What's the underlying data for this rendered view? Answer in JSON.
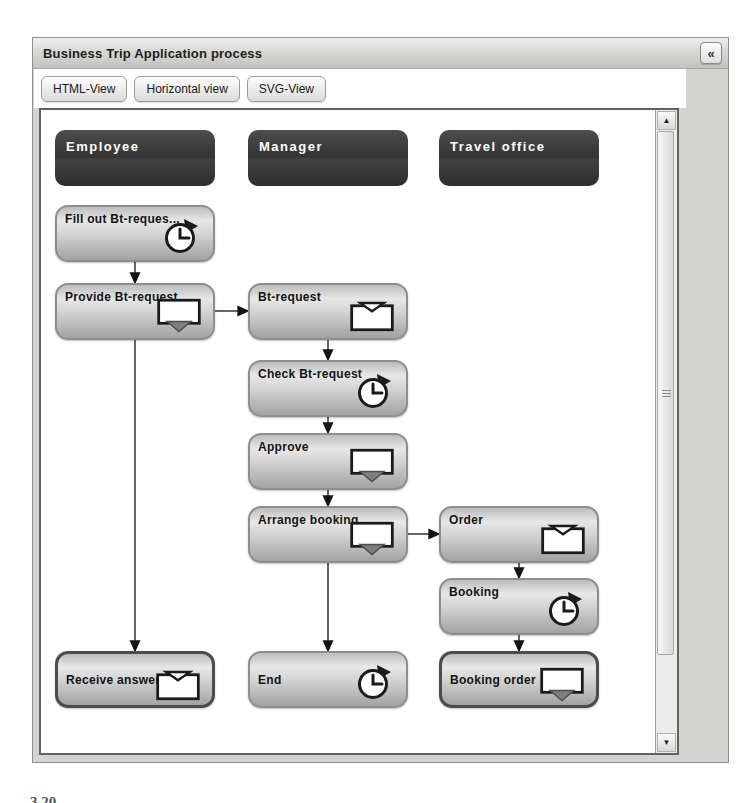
{
  "window": {
    "title": "Business Trip Application process",
    "collapse_button_glyph": "«"
  },
  "toolbar": {
    "buttons": [
      {
        "label": "HTML-View"
      },
      {
        "label": "Horizontal view"
      },
      {
        "label": "SVG-View"
      }
    ]
  },
  "diagram": {
    "lanes": [
      {
        "label": "Employee"
      },
      {
        "label": "Manager"
      },
      {
        "label": "Travel office"
      }
    ],
    "nodes": [
      {
        "id": "fill-out-bt-request",
        "lane": "Employee",
        "label": "Fill out Bt-reques...",
        "icon": "timer",
        "end_event": false
      },
      {
        "id": "provide-bt-request",
        "lane": "Employee",
        "label": "Provide Bt-request",
        "icon": "send-message",
        "end_event": false
      },
      {
        "id": "bt-request",
        "lane": "Manager",
        "label": "Bt-request",
        "icon": "receive-message",
        "end_event": false
      },
      {
        "id": "check-bt-request",
        "lane": "Manager",
        "label": "Check Bt-request",
        "icon": "timer",
        "end_event": false
      },
      {
        "id": "approve",
        "lane": "Manager",
        "label": "Approve",
        "icon": "send-message",
        "end_event": false
      },
      {
        "id": "arrange-booking",
        "lane": "Manager",
        "label": "Arrange booking",
        "icon": "send-message",
        "end_event": false
      },
      {
        "id": "order",
        "lane": "Travel office",
        "label": "Order",
        "icon": "receive-message",
        "end_event": false
      },
      {
        "id": "booking",
        "lane": "Travel office",
        "label": "Booking",
        "icon": "timer",
        "end_event": false
      },
      {
        "id": "receive-answer",
        "lane": "Employee",
        "label": "Receive answer",
        "icon": "receive-message",
        "end_event": true
      },
      {
        "id": "end",
        "lane": "Manager",
        "label": "End",
        "icon": "timer",
        "end_event": false
      },
      {
        "id": "booking-order",
        "lane": "Travel office",
        "label": "Booking order",
        "icon": "send-message",
        "end_event": true
      }
    ],
    "edges": [
      {
        "from": "fill-out-bt-request",
        "to": "provide-bt-request"
      },
      {
        "from": "provide-bt-request",
        "to": "bt-request"
      },
      {
        "from": "bt-request",
        "to": "check-bt-request"
      },
      {
        "from": "check-bt-request",
        "to": "approve"
      },
      {
        "from": "approve",
        "to": "arrange-booking"
      },
      {
        "from": "arrange-booking",
        "to": "order"
      },
      {
        "from": "arrange-booking",
        "to": "end"
      },
      {
        "from": "provide-bt-request",
        "to": "receive-answer"
      },
      {
        "from": "order",
        "to": "booking"
      },
      {
        "from": "booking",
        "to": "booking-order"
      }
    ]
  },
  "scrollbar": {
    "up_glyph": "▲",
    "down_glyph": "▼"
  },
  "caption_fragment": "3.20",
  "colors": {
    "lane_header": "#3a3a3a",
    "node_border": "#8e8e8e",
    "end_node_border": "#4c4c4c",
    "arrow": "#141414",
    "titlebar_text": "#1f1f1f"
  }
}
